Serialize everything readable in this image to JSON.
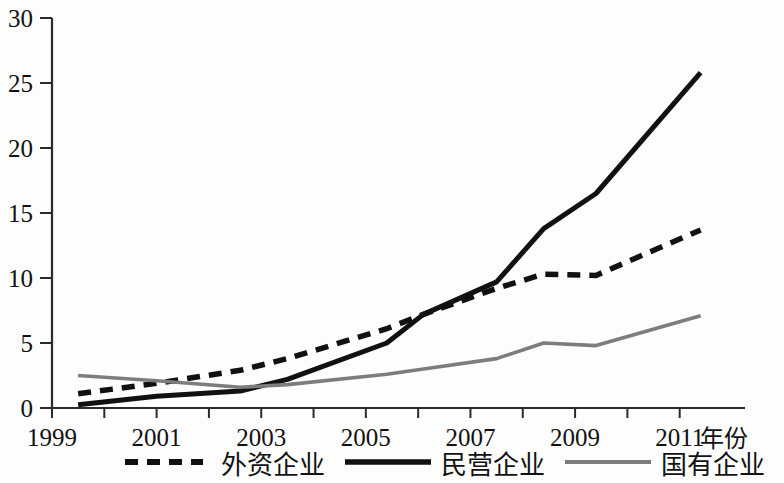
{
  "chart_data": {
    "type": "line",
    "title": "",
    "xlabel": "年份",
    "ylabel": "",
    "xlim": [
      1999,
      2012
    ],
    "ylim": [
      0,
      30
    ],
    "grid": false,
    "legend_position": "bottom",
    "x_ticks": [
      "1999",
      "2001",
      "2003",
      "2005",
      "2007",
      "2009",
      "2011"
    ],
    "x_tick_values": [
      1999,
      2001,
      2003,
      2005,
      2007,
      2009,
      2011
    ],
    "y_ticks": [
      "0",
      "5",
      "10",
      "15",
      "20",
      "25",
      "30"
    ],
    "y_tick_values": [
      0,
      5,
      10,
      15,
      20,
      25,
      30
    ],
    "x": [
      1999.5,
      2001,
      2002.6,
      2003.5,
      2005.4,
      2006.1,
      2007.5,
      2008.4,
      2009.4,
      2011.4
    ],
    "series": [
      {
        "name": "外资企业",
        "style": "dashed",
        "color": "#111111",
        "values": [
          1.1,
          1.9,
          2.9,
          3.8,
          6.1,
          7.2,
          9.2,
          10.3,
          10.2,
          13.7
        ]
      },
      {
        "name": "民营企业",
        "style": "solid-thick",
        "color": "#111111",
        "values": [
          0.25,
          0.9,
          1.3,
          2.2,
          5.0,
          7.2,
          9.7,
          13.8,
          16.5,
          25.8
        ]
      },
      {
        "name": "国有企业",
        "style": "solid-gray",
        "color": "#7d7d7d",
        "values": [
          2.5,
          2.1,
          1.6,
          1.8,
          2.6,
          3.0,
          3.8,
          5.0,
          4.8,
          7.1
        ]
      }
    ]
  },
  "axis": {
    "x_label": "年份"
  },
  "legend": {
    "items": [
      {
        "label": "外资企业",
        "style": "dashed"
      },
      {
        "label": "民营企业",
        "style": "solid-thick"
      },
      {
        "label": "国有企业",
        "style": "solid-gray"
      }
    ]
  }
}
